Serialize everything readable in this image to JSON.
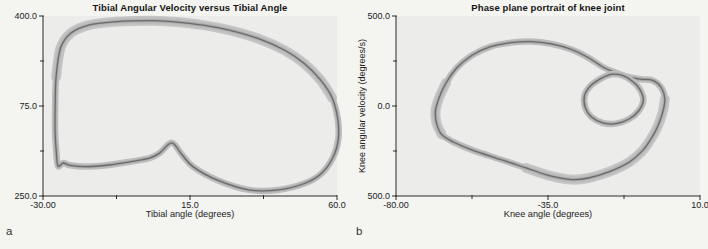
{
  "figure": {
    "bg_color": "#f4f4f1",
    "plot_bg_color": "#ecedeb",
    "axis_color": "#2a2a2a",
    "text_color": "#222222",
    "band_color": "#bdbdbd",
    "band_halo_color": "#c6c6c6",
    "band_inner_color": "#a9a9a9",
    "mean_line_color": "#6b6b6b"
  },
  "chart_data": [
    {
      "type": "line",
      "panel_label": "a",
      "title": "Tibial Angular Velocity versus Tibial Angle",
      "xlabel": "Tibial angle (degrees)",
      "ylabel": "",
      "x_axis": {
        "min": -30,
        "max": 60,
        "ticks": [
          {
            "v": -30,
            "label": "-30.00"
          },
          {
            "v": -7.5
          },
          {
            "v": 15,
            "label": "15.0"
          },
          {
            "v": 37.5
          },
          {
            "v": 60,
            "label": "60.0"
          }
        ]
      },
      "y_axis": {
        "min": -250,
        "max": 400,
        "ticks": [
          {
            "v": 400,
            "label": "400.0"
          },
          {
            "v": 237.5
          },
          {
            "v": 75,
            "label": "75.0"
          },
          {
            "v": -87.5
          },
          {
            "v": -250,
            "label": "250.0"
          }
        ]
      },
      "series": [
        {
          "name": "tibial-mean-cycle-with-sd-band",
          "closed": true,
          "wide_segments": [
            [
              1,
              14
            ]
          ],
          "points": [
            [
              -26.3,
              60
            ],
            [
              -26.0,
              180
            ],
            [
              -24.6,
              285
            ],
            [
              -21.5,
              338
            ],
            [
              -16,
              367
            ],
            [
              -8,
              379
            ],
            [
              3,
              383
            ],
            [
              10,
              379
            ],
            [
              19,
              367
            ],
            [
              27,
              349
            ],
            [
              36,
              318
            ],
            [
              44,
              276
            ],
            [
              50,
              228
            ],
            [
              55,
              168
            ],
            [
              58.5,
              105
            ],
            [
              60.2,
              30
            ],
            [
              60.4,
              -45
            ],
            [
              58.8,
              -110
            ],
            [
              55.3,
              -168
            ],
            [
              50,
              -205
            ],
            [
              42,
              -228
            ],
            [
              33,
              -228
            ],
            [
              23.4,
              -193
            ],
            [
              16,
              -145
            ],
            [
              12.5,
              -100
            ],
            [
              9.4,
              -58
            ],
            [
              5.7,
              -95
            ],
            [
              2.6,
              -113
            ],
            [
              -2.6,
              -125
            ],
            [
              -9.9,
              -138
            ],
            [
              -17,
              -144
            ],
            [
              -21.7,
              -139
            ],
            [
              -23.8,
              -131
            ],
            [
              -25.4,
              -142
            ],
            [
              -25.9,
              -95
            ],
            [
              -26.3,
              -20
            ]
          ]
        }
      ]
    },
    {
      "type": "line",
      "panel_label": "b",
      "title": "Phase plane portrait of knee joint",
      "xlabel": "Knee angle (degrees)",
      "ylabel": "Knee angular velocity (degrees/s)",
      "x_axis": {
        "min": -80,
        "max": 10,
        "ticks": [
          {
            "v": -80,
            "label": "-80.00"
          },
          {
            "v": -57.5
          },
          {
            "v": -35,
            "label": "-35.0"
          },
          {
            "v": -12.5
          },
          {
            "v": 10,
            "label": "10.0"
          }
        ]
      },
      "y_axis": {
        "min": -500,
        "max": 500,
        "ticks": [
          {
            "v": 500,
            "label": "500.0"
          },
          {
            "v": 250
          },
          {
            "v": 0,
            "label": "0.0"
          },
          {
            "v": -250
          },
          {
            "v": -500,
            "label": "500.0"
          }
        ]
      },
      "series": [
        {
          "name": "knee-outer-cycle-with-sd-band",
          "closed": true,
          "wide_segments": [
            [
              0,
              4
            ],
            [
              19,
              29
            ]
          ],
          "points": [
            [
              -66.5,
              -158
            ],
            [
              -68.0,
              -95
            ],
            [
              -68.3,
              -25
            ],
            [
              -67.2,
              48
            ],
            [
              -65.2,
              128
            ],
            [
              -62,
              212
            ],
            [
              -57.5,
              282
            ],
            [
              -52,
              330
            ],
            [
              -46,
              352
            ],
            [
              -40,
              358
            ],
            [
              -34,
              345
            ],
            [
              -28,
              314
            ],
            [
              -23,
              268
            ],
            [
              -18.5,
              214
            ],
            [
              -14.5,
              182
            ],
            [
              -11,
              160
            ],
            [
              -7.5,
              149
            ],
            [
              -4,
              142
            ],
            [
              -1.5,
              103
            ],
            [
              -0.4,
              38
            ],
            [
              -1.1,
              -38
            ],
            [
              -2.5,
              -112
            ],
            [
              -4.5,
              -182
            ],
            [
              -7,
              -248
            ],
            [
              -11,
              -312
            ],
            [
              -17,
              -366
            ],
            [
              -23,
              -400
            ],
            [
              -28,
              -409
            ],
            [
              -34,
              -390
            ],
            [
              -41.5,
              -344
            ],
            [
              -49,
              -297
            ],
            [
              -57,
              -248
            ],
            [
              -63,
              -200
            ]
          ]
        },
        {
          "name": "knee-inner-loop-with-sd-band",
          "closed": true,
          "wide_segments": [],
          "points": [
            [
              -13,
              170
            ],
            [
              -10,
              138
            ],
            [
              -7.8,
              92
            ],
            [
              -6.8,
              32
            ],
            [
              -8.2,
              -28
            ],
            [
              -11,
              -72
            ],
            [
              -14.8,
              -98
            ],
            [
              -18.8,
              -94
            ],
            [
              -22.2,
              -60
            ],
            [
              -24,
              -8
            ],
            [
              -24.2,
              58
            ],
            [
              -22.4,
              112
            ],
            [
              -19.4,
              152
            ],
            [
              -16.3,
              176
            ]
          ]
        }
      ]
    }
  ]
}
